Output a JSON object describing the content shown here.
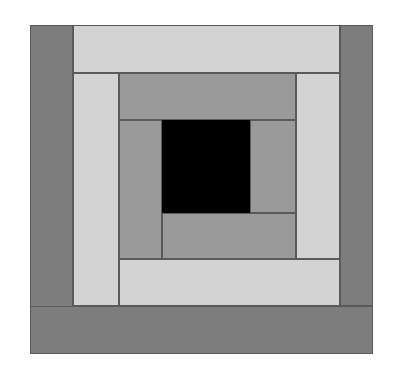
{
  "artwork": {
    "title": "Log Cabin Quilt Block",
    "pattern_name": "Log Cabin",
    "background_color": "#ffffff",
    "outline_color": "#5a5a5a",
    "canvas": {
      "width": 396,
      "height": 380
    },
    "block_bounds": {
      "x": 30,
      "y": 25,
      "width": 343,
      "height": 329
    },
    "palette": {
      "dark": "#7d7d7d",
      "medium": "#9a9a9a",
      "light": "#d3d3d3",
      "center": "#000000"
    },
    "patches": [
      {
        "name": "outer-left-dark-strip",
        "shade": "dark",
        "color": "#7d7d7d",
        "x": 0,
        "y": 0,
        "w": 43,
        "h": 329,
        "ring": 1
      },
      {
        "name": "outer-top-light-strip",
        "shade": "light",
        "color": "#d3d3d3",
        "x": 43,
        "y": 0,
        "w": 267,
        "h": 48,
        "ring": 1
      },
      {
        "name": "outer-right-dark-strip",
        "shade": "dark",
        "color": "#7d7d7d",
        "x": 310,
        "y": 0,
        "w": 33,
        "h": 281,
        "ring": 1
      },
      {
        "name": "outer-bottom-dark-strip",
        "shade": "dark",
        "color": "#7d7d7d",
        "x": 0,
        "y": 281,
        "w": 343,
        "h": 48,
        "ring": 1
      },
      {
        "name": "mid-left-light-strip",
        "shade": "light",
        "color": "#d3d3d3",
        "x": 43,
        "y": 48,
        "w": 46,
        "h": 233,
        "ring": 2
      },
      {
        "name": "mid-top-medium-strip",
        "shade": "medium",
        "color": "#9a9a9a",
        "x": 89,
        "y": 48,
        "w": 177,
        "h": 47,
        "ring": 2
      },
      {
        "name": "mid-right-light-strip",
        "shade": "light",
        "color": "#d3d3d3",
        "x": 266,
        "y": 48,
        "w": 44,
        "h": 186,
        "ring": 2
      },
      {
        "name": "mid-bottom-light-strip",
        "shade": "light",
        "color": "#d3d3d3",
        "x": 89,
        "y": 234,
        "w": 221,
        "h": 47,
        "ring": 2
      },
      {
        "name": "inner-left-medium-strip",
        "shade": "medium",
        "color": "#9a9a9a",
        "x": 89,
        "y": 95,
        "w": 43,
        "h": 139,
        "ring": 3
      },
      {
        "name": "inner-right-medium-strip",
        "shade": "medium",
        "color": "#9a9a9a",
        "x": 220,
        "y": 95,
        "w": 46,
        "h": 93,
        "ring": 3
      },
      {
        "name": "inner-bottom-medium-strip",
        "shade": "medium",
        "color": "#9a9a9a",
        "x": 132,
        "y": 188,
        "w": 134,
        "h": 46,
        "ring": 3
      },
      {
        "name": "center-black-square",
        "shade": "center",
        "color": "#000000",
        "x": 132,
        "y": 95,
        "w": 88,
        "h": 93,
        "ring": 4
      }
    ]
  }
}
